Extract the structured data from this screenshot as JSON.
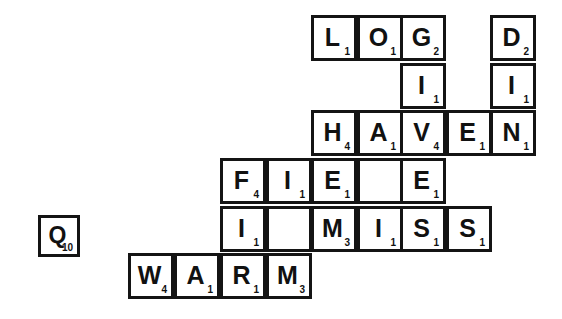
{
  "puzzle": {
    "title": "Scrabble tile crossword layout",
    "geometry": {
      "cell_size": 46,
      "col_x": [
        128,
        174,
        220,
        266,
        311,
        357,
        400,
        446,
        490
      ],
      "row_y": [
        15,
        63,
        110,
        158,
        206,
        253
      ]
    },
    "words": {
      "across": [
        "LOG",
        "HAVEN",
        "FIE",
        "MISS",
        "WARM"
      ],
      "down": [
        "GIVES",
        "DIN",
        "FI",
        "OAI",
        "EE"
      ]
    },
    "tiles": [
      {
        "letter": "L",
        "value": "1",
        "col": 4,
        "row": 0
      },
      {
        "letter": "O",
        "value": "1",
        "col": 5,
        "row": 0
      },
      {
        "letter": "G",
        "value": "2",
        "col": 6,
        "row": 0
      },
      {
        "letter": "D",
        "value": "2",
        "col": 8,
        "row": 0
      },
      {
        "letter": "I",
        "value": "1",
        "col": 6,
        "row": 1
      },
      {
        "letter": "I",
        "value": "1",
        "col": 8,
        "row": 1
      },
      {
        "letter": "H",
        "value": "4",
        "col": 4,
        "row": 2
      },
      {
        "letter": "A",
        "value": "1",
        "col": 5,
        "row": 2
      },
      {
        "letter": "V",
        "value": "4",
        "col": 6,
        "row": 2
      },
      {
        "letter": "E",
        "value": "1",
        "col": 7,
        "row": 2
      },
      {
        "letter": "N",
        "value": "1",
        "col": 8,
        "row": 2
      },
      {
        "letter": "F",
        "value": "4",
        "col": 2,
        "row": 3
      },
      {
        "letter": "I",
        "value": "1",
        "col": 3,
        "row": 3
      },
      {
        "letter": "E",
        "value": "1",
        "col": 4,
        "row": 3
      },
      {
        "letter": "",
        "value": "",
        "col": 5,
        "row": 3
      },
      {
        "letter": "E",
        "value": "1",
        "col": 6,
        "row": 3
      },
      {
        "letter": "I",
        "value": "1",
        "col": 2,
        "row": 4
      },
      {
        "letter": "",
        "value": "",
        "col": 3,
        "row": 4
      },
      {
        "letter": "M",
        "value": "3",
        "col": 4,
        "row": 4
      },
      {
        "letter": "I",
        "value": "1",
        "col": 5,
        "row": 4
      },
      {
        "letter": "S",
        "value": "1",
        "col": 6,
        "row": 4
      },
      {
        "letter": "S",
        "value": "1",
        "col": 7,
        "row": 4
      },
      {
        "letter": "W",
        "value": "4",
        "col": 0,
        "row": 5
      },
      {
        "letter": "A",
        "value": "1",
        "col": 1,
        "row": 5
      },
      {
        "letter": "R",
        "value": "1",
        "col": 2,
        "row": 5
      },
      {
        "letter": "M",
        "value": "3",
        "col": 3,
        "row": 5
      }
    ],
    "loose_tile": {
      "letter": "Q",
      "value": "10",
      "x": 38,
      "y": 215,
      "size": 42
    }
  }
}
